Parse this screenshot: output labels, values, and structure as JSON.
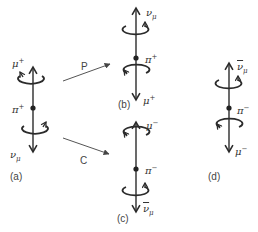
{
  "figure": {
    "panels": {
      "a": {
        "label": "(a)",
        "top_particle": {
          "base": "μ",
          "sup": "+",
          "sub": "",
          "bar": false
        },
        "center_particle": {
          "base": "π",
          "sup": "+"
        },
        "bottom_particle": {
          "base": "ν",
          "sup": "",
          "sub": "μ",
          "bar": false
        }
      },
      "b": {
        "label": "(b)",
        "top_particle": {
          "base": "ν",
          "sup": "",
          "sub": "μ",
          "bar": false
        },
        "center_particle": {
          "base": "π",
          "sup": "+"
        },
        "bottom_particle": {
          "base": "μ",
          "sup": "+",
          "sub": "",
          "bar": false
        }
      },
      "c": {
        "label": "(c)",
        "top_particle": {
          "base": "μ",
          "sup": "−",
          "sub": "",
          "bar": false
        },
        "center_particle": {
          "base": "π",
          "sup": "−"
        },
        "bottom_particle": {
          "base": "ν",
          "sup": "",
          "sub": "μ",
          "bar": true
        }
      },
      "d": {
        "label": "(d)",
        "top_particle": {
          "base": "ν",
          "sup": "",
          "sub": "μ",
          "bar": true
        },
        "center_particle": {
          "base": "π",
          "sup": "−"
        },
        "bottom_particle": {
          "base": "μ",
          "sup": "−",
          "sub": "",
          "bar": false
        }
      }
    },
    "transforms": {
      "parity": {
        "label": "P",
        "from": "a",
        "to": "b"
      },
      "charge_conjugation": {
        "label": "C",
        "from": "a",
        "to": "c"
      }
    },
    "colors": {
      "line": "#2b2b2b",
      "text": "#333333",
      "background": "#ffffff"
    }
  }
}
